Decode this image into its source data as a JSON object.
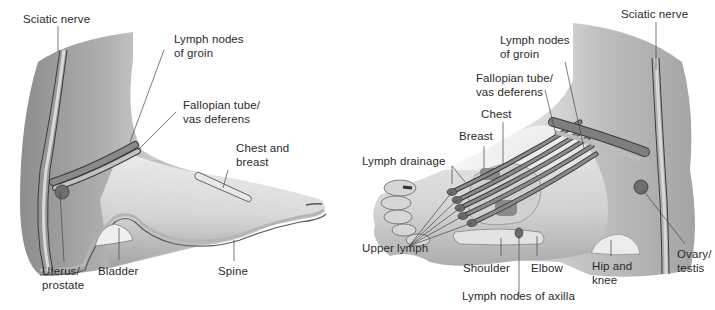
{
  "diagram": {
    "colors": {
      "skin_light": "#e6e6e6",
      "skin_mid": "#c9c9c9",
      "skin_dark": "#9a9a9a",
      "band_dark": "#6e6e6e",
      "band_mid": "#a8a8a8",
      "outline": "#3c3c3c",
      "leader_line": "#444444",
      "text": "#2a2a2a"
    },
    "left_foot": {
      "view": "medial",
      "labels": [
        {
          "id": "sciatic-nerve",
          "text": [
            "Sciatic nerve"
          ]
        },
        {
          "id": "lymph-nodes-groin",
          "text": [
            "Lymph nodes",
            "of groin"
          ]
        },
        {
          "id": "fallopian-tube",
          "text": [
            "Fallopian tube/",
            "vas deferens"
          ]
        },
        {
          "id": "chest-breast",
          "text": [
            "Chest and",
            "breast"
          ]
        },
        {
          "id": "uterus-prostate",
          "text": [
            "Uterus/",
            "prostate"
          ]
        },
        {
          "id": "bladder",
          "text": [
            "Bladder"
          ]
        },
        {
          "id": "spine",
          "text": [
            "Spine"
          ]
        }
      ]
    },
    "right_foot": {
      "view": "lateral",
      "labels": [
        {
          "id": "sciatic-nerve",
          "text": [
            "Sciatic nerve"
          ]
        },
        {
          "id": "lymph-nodes-groin",
          "text": [
            "Lymph nodes",
            "of groin"
          ]
        },
        {
          "id": "fallopian-tube",
          "text": [
            "Fallopian tube/",
            "vas deferens"
          ]
        },
        {
          "id": "chest",
          "text": [
            "Chest"
          ]
        },
        {
          "id": "breast",
          "text": [
            "Breast"
          ]
        },
        {
          "id": "lymph-drainage",
          "text": [
            "Lymph drainage"
          ]
        },
        {
          "id": "upper-lymph",
          "text": [
            "Upper lymph"
          ]
        },
        {
          "id": "shoulder",
          "text": [
            "Shoulder"
          ]
        },
        {
          "id": "elbow",
          "text": [
            "Elbow"
          ]
        },
        {
          "id": "lymph-nodes-axilla",
          "text": [
            "Lymph nodes of axilla"
          ]
        },
        {
          "id": "hip-knee",
          "text": [
            "Hip and",
            "knee"
          ]
        },
        {
          "id": "ovary-testis",
          "text": [
            "Ovary/",
            "testis"
          ]
        }
      ]
    }
  }
}
